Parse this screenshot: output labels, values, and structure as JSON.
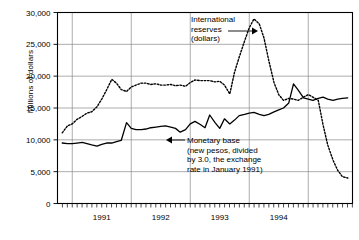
{
  "chart_data": {
    "type": "line",
    "title": "",
    "xlabel": "",
    "ylabel": "Millions of dollars",
    "ylim": [
      0,
      30000
    ],
    "yticks": [
      0,
      5000,
      10000,
      15000,
      20000,
      25000,
      30000
    ],
    "ytick_labels": [
      "0",
      "5,000",
      "10,000",
      "15,000",
      "20,000",
      "25,000",
      "30,000"
    ],
    "xlim": [
      1990.75,
      1995.75
    ],
    "xtick_labels": [
      "1991",
      "1992",
      "1993",
      "1994"
    ],
    "xtick_positions": [
      1991.5,
      1992.5,
      1993.5,
      1994.5
    ],
    "xgridlines": [
      1991.0,
      1992.0,
      1993.0,
      1994.0,
      1995.0
    ],
    "minor_tick_interval_years": 0.0833,
    "grid": true,
    "legend": "none",
    "series": [
      {
        "name": "International reserves (dollars)",
        "style": "dotted",
        "color": "#000000",
        "x": [
          1990.83,
          1990.92,
          1991.0,
          1991.08,
          1991.17,
          1991.25,
          1991.33,
          1991.42,
          1991.5,
          1991.58,
          1991.67,
          1991.75,
          1991.83,
          1991.92,
          1992.0,
          1992.08,
          1992.17,
          1992.25,
          1992.33,
          1992.42,
          1992.5,
          1992.58,
          1992.67,
          1992.75,
          1992.83,
          1992.92,
          1993.0,
          1993.08,
          1993.17,
          1993.25,
          1993.33,
          1993.42,
          1993.5,
          1993.58,
          1993.67,
          1993.75,
          1993.83,
          1993.92,
          1994.0,
          1994.08,
          1994.17,
          1994.25,
          1994.33,
          1994.42,
          1994.5,
          1994.58,
          1994.67,
          1994.75,
          1994.83,
          1994.92,
          1995.0,
          1995.08,
          1995.17,
          1995.25,
          1995.33,
          1995.42,
          1995.5,
          1995.58,
          1995.67
        ],
        "y": [
          11100,
          12200,
          12500,
          13200,
          13700,
          14200,
          14400,
          15200,
          16400,
          17800,
          19500,
          18900,
          17900,
          17600,
          18300,
          18600,
          18900,
          18900,
          18700,
          18800,
          18600,
          18600,
          18700,
          18500,
          18600,
          18400,
          19000,
          19400,
          19300,
          19300,
          19300,
          19100,
          19200,
          18600,
          17200,
          20600,
          23000,
          25500,
          27600,
          29000,
          28200,
          26000,
          22500,
          19000,
          17100,
          16200,
          16500,
          16400,
          16200,
          16700,
          17100,
          16700,
          16200,
          12400,
          9200,
          6800,
          5200,
          4200,
          4000
        ]
      },
      {
        "name": "Monetary base (new pesos, divided by 3.0, the exchange rate in January 1991)",
        "style": "solid",
        "color": "#000000",
        "x": [
          1990.83,
          1990.92,
          1991.0,
          1991.08,
          1991.17,
          1991.25,
          1991.33,
          1991.42,
          1991.5,
          1991.58,
          1991.67,
          1991.75,
          1991.83,
          1991.92,
          1992.0,
          1992.08,
          1992.17,
          1992.25,
          1992.33,
          1992.42,
          1992.5,
          1992.58,
          1992.67,
          1992.75,
          1992.83,
          1992.92,
          1993.0,
          1993.08,
          1993.17,
          1993.25,
          1993.33,
          1993.42,
          1993.5,
          1993.58,
          1993.67,
          1993.75,
          1993.83,
          1993.92,
          1994.0,
          1994.08,
          1994.17,
          1994.25,
          1994.33,
          1994.42,
          1994.5,
          1994.58,
          1994.67,
          1994.75,
          1994.83,
          1994.92,
          1995.0,
          1995.08,
          1995.17,
          1995.25,
          1995.33,
          1995.42,
          1995.5,
          1995.58,
          1995.67
        ],
        "y": [
          9500,
          9400,
          9400,
          9500,
          9600,
          9400,
          9200,
          9000,
          9300,
          9500,
          9500,
          9700,
          9900,
          12700,
          11800,
          11600,
          11600,
          11700,
          11900,
          12000,
          12100,
          12200,
          12000,
          11800,
          11200,
          11600,
          12500,
          12900,
          12400,
          11900,
          13900,
          12700,
          11800,
          13300,
          12500,
          13100,
          13800,
          14000,
          14200,
          14300,
          14000,
          13800,
          14000,
          14400,
          14700,
          15000,
          15800,
          18800,
          17800,
          16600,
          16400,
          16200,
          16500,
          16700,
          16400,
          16200,
          16400,
          16500,
          16600
        ]
      }
    ],
    "annotations": [
      {
        "id": "reserves-annotation",
        "lines": [
          "International",
          "reserves",
          "(dollars)"
        ],
        "arrow": "right"
      },
      {
        "id": "monetary-base-annotation",
        "lines": [
          "Monetary base",
          "(new pesos, divided",
          "by 3.0, the exchange",
          "rate in January 1991)"
        ],
        "arrow": "left"
      }
    ]
  }
}
